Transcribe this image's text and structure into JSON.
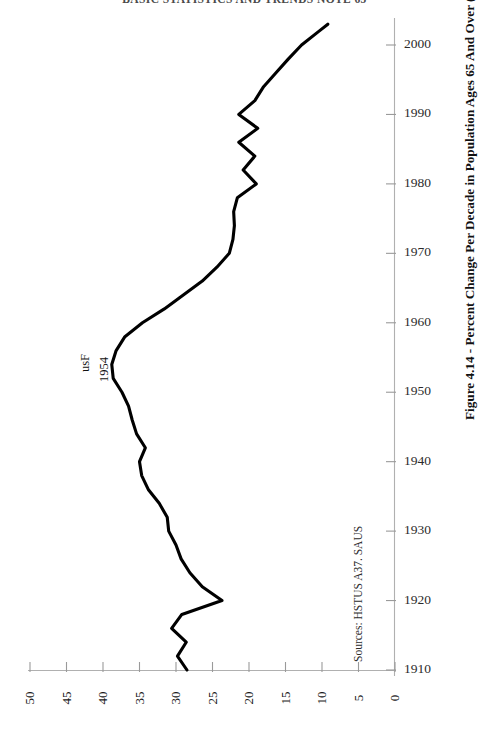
{
  "page": {
    "running_header": "BASIC STATISTICS AND TRENDS  NOTE  65"
  },
  "caption": {
    "text": "Figure 4.14 - Percent Change Per Decade in Population Ages 65 And Over (U.S.)"
  },
  "sources": {
    "text": "Sources: HSTUS A37. SAUS"
  },
  "annotation": {
    "line1": "usF",
    "line2": "1954"
  },
  "colors": {
    "line": "#000000",
    "axis": "#9a9a9a",
    "text": "#1a1a1a",
    "background": "#ffffff"
  },
  "chart_data": {
    "type": "line",
    "orientation": "horizontal-value-axis-reversed",
    "title": "Figure 4.14 - Percent Change Per Decade in Population Ages 65 And Over (U.S.)",
    "xlabel": "Percent Change Per Decade",
    "ylabel": "Year",
    "xlim": [
      50,
      0
    ],
    "ylim": [
      1910,
      2005
    ],
    "grid": false,
    "legend": null,
    "xticks": [
      50,
      45,
      40,
      35,
      30,
      25,
      20,
      15,
      10,
      5,
      0
    ],
    "yticks": [
      2000,
      1990,
      1980,
      1970,
      1960,
      1950,
      1940,
      1930,
      1920,
      1910
    ],
    "series": [
      {
        "name": "Percent change per decade, population 65+",
        "x": [
          1910,
          1912,
          1914,
          1916,
          1918,
          1920,
          1922,
          1924,
          1926,
          1928,
          1930,
          1932,
          1934,
          1936,
          1938,
          1940,
          1942,
          1944,
          1946,
          1948,
          1950,
          1952,
          1954,
          1956,
          1958,
          1960,
          1962,
          1964,
          1966,
          1968,
          1970,
          1972,
          1974,
          1976,
          1978,
          1980,
          1982,
          1984,
          1986,
          1988,
          1990,
          1992,
          1994,
          1996,
          1998,
          2000,
          2002,
          2003
        ],
        "y": [
          28.5,
          29.8,
          28.6,
          30.6,
          29.2,
          23.7,
          26.4,
          28.1,
          29.3,
          30.0,
          31.0,
          31.2,
          32.3,
          33.8,
          34.7,
          35.0,
          34.2,
          35.4,
          36.0,
          36.5,
          37.4,
          38.6,
          38.8,
          38.2,
          37.0,
          34.6,
          31.6,
          29.0,
          26.4,
          24.4,
          22.7,
          22.2,
          22.0,
          22.1,
          21.6,
          19.0,
          20.8,
          19.2,
          21.4,
          18.8,
          21.4,
          19.2,
          18.0,
          16.3,
          14.6,
          12.8,
          10.4,
          9.2
        ]
      }
    ]
  },
  "axes": {
    "x_tick_labels": [
      "50",
      "45",
      "40",
      "35",
      "30",
      "25",
      "20",
      "15",
      "10",
      "5",
      "0"
    ],
    "y_tick_labels": [
      "2000",
      "1990",
      "1980",
      "1970",
      "1960",
      "1950",
      "1940",
      "1930",
      "1920",
      "1910"
    ]
  }
}
